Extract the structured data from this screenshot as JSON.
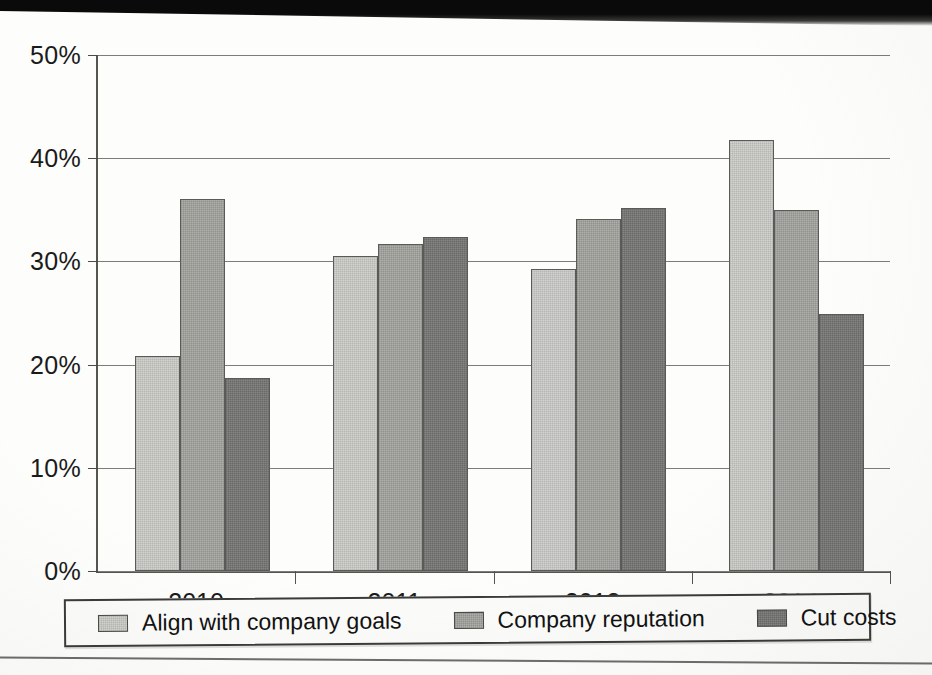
{
  "chart_data": {
    "type": "bar",
    "title": "",
    "subtitle": "",
    "xlabel": "",
    "ylabel": "",
    "categories": [
      "2010",
      "2011",
      "2012",
      "2014"
    ],
    "series": [
      {
        "name": "Align with company goals",
        "color": "#d2d2cf",
        "values": [
          20.8,
          30.5,
          29.3,
          41.8
        ]
      },
      {
        "name": "Company reputation",
        "color": "#aeaeaa",
        "values": [
          36.0,
          31.7,
          34.1,
          35.0
        ]
      },
      {
        "name": "Cut costs",
        "color": "#858583",
        "values": [
          18.7,
          32.4,
          35.2,
          24.9
        ]
      }
    ],
    "ylim": [
      0,
      50
    ],
    "ytick_values": [
      0,
      10,
      20,
      30,
      40,
      50
    ],
    "ytick_labels": [
      "0%",
      "10%",
      "20%",
      "30%",
      "40%",
      "50%"
    ],
    "grid": true,
    "grid_axis": "y",
    "legend_position": "bottom",
    "value_suffix": "%"
  },
  "legend": {
    "items": [
      {
        "label": "Align with company goals",
        "swatch": "legend-swatch-align-with-company-goals"
      },
      {
        "label": "Company reputation",
        "swatch": "legend-swatch-company-reputation"
      },
      {
        "label": "Cut costs",
        "swatch": "legend-swatch-cut-costs"
      }
    ]
  },
  "colors": {
    "series_light": "#d2d2cf",
    "series_medium": "#aeaeaa",
    "series_dark": "#858583",
    "axis": "#55554f",
    "gridline": "#7c7c78",
    "text": "#1a1a1a",
    "page_background": "#fdfdfb"
  }
}
